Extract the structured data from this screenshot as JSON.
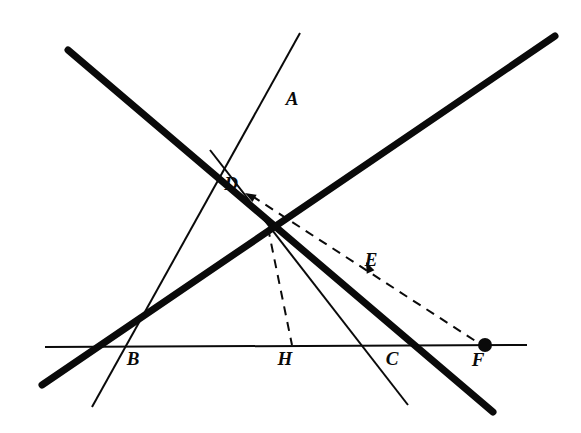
{
  "figure": {
    "width": 581,
    "height": 433,
    "background_color": "#ffffff",
    "ink_color": "#0a0a0a",
    "labels": [
      {
        "id": "A",
        "text": "A",
        "x": 292,
        "y": 105
      },
      {
        "id": "B",
        "text": "B",
        "x": 133,
        "y": 365
      },
      {
        "id": "C",
        "text": "C",
        "x": 392,
        "y": 365
      },
      {
        "id": "D",
        "text": "D",
        "x": 231,
        "y": 190
      },
      {
        "id": "E",
        "text": "E",
        "x": 371,
        "y": 266
      },
      {
        "id": "F",
        "text": "F",
        "x": 478,
        "y": 366
      },
      {
        "id": "H",
        "text": "H",
        "x": 285,
        "y": 365
      }
    ],
    "points": [
      {
        "id": "A",
        "x": 318,
        "y": 99,
        "marked": false
      },
      {
        "id": "B",
        "x": 132,
        "y": 347,
        "marked": false
      },
      {
        "id": "C",
        "x": 390,
        "y": 346,
        "marked": false
      },
      {
        "id": "D",
        "x": 243,
        "y": 198,
        "marked": false
      },
      {
        "id": "E",
        "x": 366,
        "y": 262,
        "marked": false
      },
      {
        "id": "F",
        "x": 485,
        "y": 345,
        "marked": true
      },
      {
        "id": "H",
        "x": 292,
        "y": 346,
        "marked": false
      },
      {
        "id": "G",
        "x": 268,
        "y": 228,
        "marked": false
      }
    ],
    "dot_radius": 7,
    "segments": [
      {
        "id": "thick-descending",
        "name": "thick-line-down-right",
        "style": "thick",
        "width": 7,
        "dashed": false,
        "x1": 68,
        "y1": 50,
        "x2": 493,
        "y2": 412
      },
      {
        "id": "thick-ascending",
        "name": "thick-line-up-right",
        "style": "thick",
        "width": 7,
        "dashed": false,
        "x1": 42,
        "y1": 385,
        "x2": 555,
        "y2": 36
      },
      {
        "id": "thin-BA",
        "name": "thin-line-through-B-and-A",
        "style": "thin",
        "width": 2,
        "dashed": false,
        "x1": 92,
        "y1": 407,
        "x2": 300,
        "y2": 33
      },
      {
        "id": "thin-CD",
        "name": "thin-line-through-C-and-D",
        "style": "thin",
        "width": 2,
        "dashed": false,
        "x1": 408,
        "y1": 405,
        "x2": 210,
        "y2": 150
      },
      {
        "id": "thin-horizontal",
        "name": "horizontal-baseline",
        "style": "thin",
        "width": 2,
        "dashed": false,
        "x1": 45,
        "y1": 347,
        "x2": 527,
        "y2": 345
      },
      {
        "id": "dashed-DF",
        "name": "dashed-line-D-to-F",
        "style": "dashed",
        "width": 2,
        "dashed": true,
        "x1": 252,
        "y1": 196,
        "x2": 480,
        "y2": 344
      },
      {
        "id": "dashed-GH",
        "name": "dashed-line-G-to-H",
        "style": "dashed",
        "width": 2,
        "dashed": true,
        "x1": 268,
        "y1": 228,
        "x2": 292,
        "y2": 345
      }
    ],
    "arrows": [
      {
        "id": "arrow-to-D",
        "name": "arrowhead-pointing-to-D",
        "tip_x": 245,
        "tip_y": 193,
        "from_x": 266,
        "from_y": 205
      },
      {
        "id": "arrow-to-E",
        "name": "arrowhead-pointing-to-E",
        "tip_x": 366,
        "tip_y": 262,
        "from_x": 371,
        "from_y": 273
      }
    ],
    "dash_pattern": "9 7"
  }
}
